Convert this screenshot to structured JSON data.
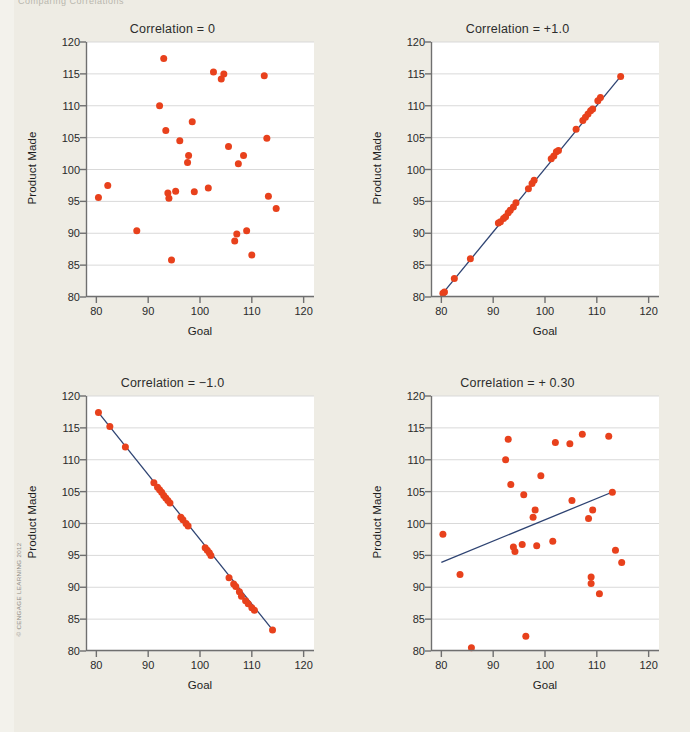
{
  "page": {
    "background_color": "#eeece4",
    "plot_background_color": "#ffffff",
    "point_color": "#e8411c",
    "line_color": "#2e4372",
    "grid_color": "#d9d9d9",
    "axis_color": "#6f6f6f",
    "copyright": "© CENGAGE LEARNING 2012",
    "top_cropped_text": "Comparing Correlations"
  },
  "axes": {
    "xlabel": "Goal",
    "ylabel": "Product Made",
    "xticks": [
      80,
      90,
      100,
      110,
      120
    ],
    "yticks": [
      80,
      85,
      90,
      95,
      100,
      105,
      110,
      115,
      120
    ],
    "xlim": [
      78,
      122
    ],
    "ylim": [
      80,
      120
    ]
  },
  "chart_data": [
    {
      "type": "scatter",
      "position": "top-left",
      "title": "Correlation = 0",
      "xlabel": "Goal",
      "ylabel": "Product Made",
      "xlim": [
        78,
        122
      ],
      "ylim": [
        80,
        120
      ],
      "grid": true,
      "trendline": null,
      "points": [
        [
          80.4,
          95.6
        ],
        [
          82.2,
          97.5
        ],
        [
          87.8,
          90.4
        ],
        [
          92.2,
          110.0
        ],
        [
          93.0,
          117.4
        ],
        [
          93.4,
          106.1
        ],
        [
          93.8,
          96.3
        ],
        [
          94.0,
          95.5
        ],
        [
          94.5,
          85.8
        ],
        [
          95.3,
          96.6
        ],
        [
          96.1,
          104.5
        ],
        [
          97.6,
          101.1
        ],
        [
          97.8,
          102.2
        ],
        [
          98.5,
          107.5
        ],
        [
          98.9,
          96.5
        ],
        [
          101.6,
          97.1
        ],
        [
          102.6,
          115.3
        ],
        [
          104.1,
          114.2
        ],
        [
          104.6,
          115.0
        ],
        [
          105.5,
          103.6
        ],
        [
          106.7,
          88.8
        ],
        [
          107.1,
          89.9
        ],
        [
          107.4,
          100.9
        ],
        [
          108.4,
          102.2
        ],
        [
          109.0,
          90.4
        ],
        [
          110.0,
          86.6
        ],
        [
          112.4,
          114.7
        ],
        [
          112.9,
          104.9
        ],
        [
          113.2,
          95.8
        ],
        [
          114.7,
          93.9
        ]
      ]
    },
    {
      "type": "scatter",
      "position": "top-right",
      "title": "Correlation = +1.0",
      "xlabel": "Goal",
      "ylabel": "Product Made",
      "xlim": [
        78,
        122
      ],
      "ylim": [
        80,
        120
      ],
      "grid": true,
      "trendline": {
        "x": [
          80.3,
          114.6
        ],
        "y": [
          80.6,
          114.6
        ]
      },
      "points": [
        [
          80.3,
          80.6
        ],
        [
          80.6,
          80.8
        ],
        [
          82.5,
          82.9
        ],
        [
          85.6,
          86.0
        ],
        [
          91.0,
          91.6
        ],
        [
          91.4,
          91.8
        ],
        [
          92.0,
          92.3
        ],
        [
          92.4,
          92.6
        ],
        [
          92.9,
          93.2
        ],
        [
          93.3,
          93.6
        ],
        [
          93.9,
          94.1
        ],
        [
          94.4,
          94.8
        ],
        [
          96.8,
          97.0
        ],
        [
          97.5,
          97.8
        ],
        [
          97.9,
          98.3
        ],
        [
          101.2,
          101.7
        ],
        [
          101.7,
          102.1
        ],
        [
          102.2,
          102.8
        ],
        [
          102.6,
          103.0
        ],
        [
          106.0,
          106.3
        ],
        [
          107.3,
          107.7
        ],
        [
          107.8,
          108.2
        ],
        [
          108.3,
          108.7
        ],
        [
          108.8,
          109.2
        ],
        [
          109.2,
          109.5
        ],
        [
          110.2,
          110.8
        ],
        [
          110.7,
          111.3
        ],
        [
          114.6,
          114.6
        ]
      ]
    },
    {
      "type": "scatter",
      "position": "bottom-left",
      "title": "Correlation = −1.0",
      "xlabel": "Goal",
      "ylabel": "Product Made",
      "xlim": [
        78,
        122
      ],
      "ylim": [
        80,
        120
      ],
      "grid": true,
      "trendline": {
        "x": [
          80.3,
          114.0
        ],
        "y": [
          117.5,
          83.3
        ]
      },
      "points": [
        [
          80.4,
          117.4
        ],
        [
          82.6,
          115.2
        ],
        [
          85.6,
          112.0
        ],
        [
          91.1,
          106.4
        ],
        [
          91.8,
          105.7
        ],
        [
          92.2,
          105.3
        ],
        [
          92.6,
          104.9
        ],
        [
          93.0,
          104.4
        ],
        [
          93.4,
          104.0
        ],
        [
          93.8,
          103.6
        ],
        [
          94.2,
          103.2
        ],
        [
          96.3,
          101.0
        ],
        [
          96.7,
          100.6
        ],
        [
          97.3,
          100.0
        ],
        [
          97.7,
          99.6
        ],
        [
          101.0,
          96.2
        ],
        [
          101.4,
          95.8
        ],
        [
          101.8,
          95.4
        ],
        [
          102.1,
          95.0
        ],
        [
          105.6,
          91.5
        ],
        [
          106.5,
          90.5
        ],
        [
          106.9,
          90.1
        ],
        [
          107.6,
          89.3
        ],
        [
          108.0,
          88.6
        ],
        [
          108.8,
          87.9
        ],
        [
          109.3,
          87.4
        ],
        [
          110.0,
          86.8
        ],
        [
          110.5,
          86.4
        ],
        [
          114.0,
          83.3
        ]
      ]
    },
    {
      "type": "scatter",
      "position": "bottom-right",
      "title": "Correlation = + 0.30",
      "xlabel": "Goal",
      "ylabel": "Product Made",
      "xlim": [
        78,
        122
      ],
      "ylim": [
        80,
        120
      ],
      "grid": true,
      "trendline": {
        "x": [
          80.0,
          113.5
        ],
        "y": [
          93.9,
          105.1
        ]
      },
      "points": [
        [
          80.3,
          98.3
        ],
        [
          83.6,
          92.0
        ],
        [
          85.8,
          80.5
        ],
        [
          92.4,
          110.0
        ],
        [
          92.9,
          113.2
        ],
        [
          93.4,
          106.1
        ],
        [
          93.9,
          96.3
        ],
        [
          94.2,
          95.6
        ],
        [
          95.6,
          96.7
        ],
        [
          95.9,
          104.5
        ],
        [
          96.3,
          82.3
        ],
        [
          97.7,
          101.0
        ],
        [
          98.1,
          102.1
        ],
        [
          98.4,
          96.5
        ],
        [
          99.2,
          107.5
        ],
        [
          101.5,
          97.2
        ],
        [
          102.0,
          112.7
        ],
        [
          104.8,
          112.5
        ],
        [
          105.2,
          103.6
        ],
        [
          107.2,
          114.0
        ],
        [
          108.4,
          100.8
        ],
        [
          108.9,
          91.6
        ],
        [
          108.9,
          90.6
        ],
        [
          109.2,
          102.1
        ],
        [
          110.5,
          89.0
        ],
        [
          112.3,
          113.7
        ],
        [
          113.0,
          104.9
        ],
        [
          113.6,
          95.8
        ],
        [
          114.8,
          93.9
        ]
      ]
    }
  ]
}
